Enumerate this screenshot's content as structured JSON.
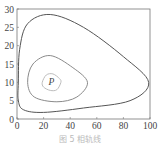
{
  "chart_data": {
    "type": "line",
    "title": "",
    "caption": "图 5   相轨线",
    "xlabel": "",
    "ylabel": "",
    "xlim": [
      0,
      100
    ],
    "ylim": [
      0,
      30
    ],
    "x_ticks": [
      "0",
      "20",
      "40",
      "60",
      "80",
      "100"
    ],
    "y_ticks": [
      "0",
      "5",
      "10",
      "15",
      "20",
      "25",
      "30"
    ],
    "grid": false,
    "annotations": [
      {
        "text": "P",
        "x": 26,
        "y": 10
      }
    ],
    "series": [
      {
        "name": "outer-orbit",
        "points": [
          [
            1,
            10
          ],
          [
            2,
            19
          ],
          [
            8,
            26
          ],
          [
            25,
            28.5
          ],
          [
            50,
            25
          ],
          [
            80,
            17
          ],
          [
            99,
            10
          ],
          [
            85,
            5
          ],
          [
            50,
            3
          ],
          [
            20,
            1.8
          ],
          [
            5,
            2.5
          ],
          [
            1,
            5
          ],
          [
            1,
            10
          ]
        ]
      },
      {
        "name": "middle-orbit",
        "points": [
          [
            8,
            10
          ],
          [
            12,
            15
          ],
          [
            25,
            17.3
          ],
          [
            42,
            14
          ],
          [
            53,
            10
          ],
          [
            45,
            6
          ],
          [
            30,
            4.7
          ],
          [
            13,
            6
          ],
          [
            8,
            10
          ]
        ]
      },
      {
        "name": "inner-orbit",
        "points": [
          [
            19,
            10
          ],
          [
            22,
            12
          ],
          [
            27,
            12.3
          ],
          [
            32,
            11
          ],
          [
            33,
            10
          ],
          [
            30,
            8
          ],
          [
            25,
            7.8
          ],
          [
            20,
            8.7
          ],
          [
            19,
            10
          ]
        ]
      }
    ],
    "colors": {
      "outer": "#555555",
      "middle": "#8a8a8a",
      "inner": "#bdbdbd"
    }
  }
}
